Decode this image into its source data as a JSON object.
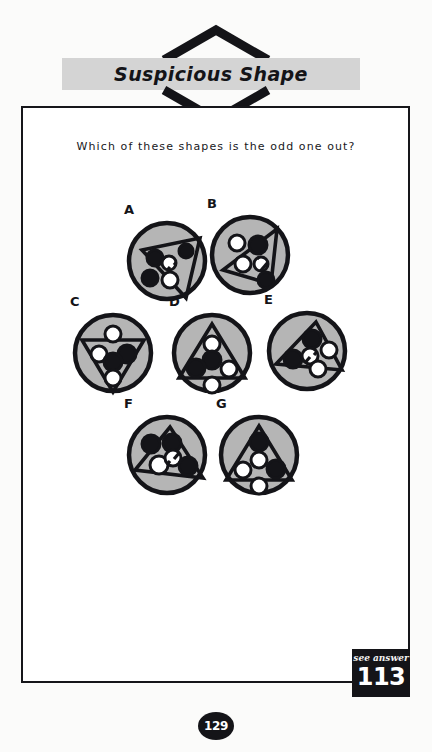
{
  "header": {
    "title": "Suspicious Shape",
    "band_color": "#d4d4d4",
    "chevron_icon": "chevron-diamond"
  },
  "question": {
    "text": "Which of these shapes is the odd one out?"
  },
  "footer": {
    "answer_label": "see answer",
    "answer_number": "113",
    "page_number": "129"
  },
  "colors": {
    "ink": "#141418",
    "disc_fill": "#b5b5b5",
    "paper": "#ffffff",
    "band": "#d4d4d4"
  },
  "puzzle": {
    "type": "odd-one-out",
    "count": 7,
    "shapes": [
      {
        "letter": "A",
        "row": 1,
        "triangle_rotation": 118,
        "triangle_points": "18,32 76,20 62,80",
        "dots": [
          {
            "name": "dot-black-left-upper",
            "cx": 31,
            "cy": 40,
            "r": 8,
            "fill": "black"
          },
          {
            "name": "dot-black-right-upper",
            "cx": 62,
            "cy": 33,
            "r": 7,
            "fill": "black"
          },
          {
            "name": "dot-slashed-center",
            "cx": 45,
            "cy": 45,
            "r": 7,
            "fill": "slashed"
          },
          {
            "name": "dot-black-left-lower",
            "cx": 26,
            "cy": 60,
            "r": 8,
            "fill": "black"
          },
          {
            "name": "dot-white-lower",
            "cx": 46,
            "cy": 62,
            "r": 8,
            "fill": "white"
          }
        ]
      },
      {
        "letter": "B",
        "row": 1,
        "triangle_rotation": 200,
        "triangle_points": "16,58 70,17 64,72",
        "dots": [
          {
            "name": "dot-white-top-left",
            "cx": 30,
            "cy": 31,
            "r": 8,
            "fill": "white"
          },
          {
            "name": "dot-black-top-center",
            "cx": 51,
            "cy": 33,
            "r": 9,
            "fill": "black"
          },
          {
            "name": "dot-white-mid-left",
            "cx": 36,
            "cy": 52,
            "r": 8,
            "fill": "white"
          },
          {
            "name": "dot-slashed-center",
            "cx": 54,
            "cy": 52,
            "r": 7,
            "fill": "slashed"
          },
          {
            "name": "dot-black-bottom",
            "cx": 59,
            "cy": 68,
            "r": 8,
            "fill": "black"
          }
        ]
      },
      {
        "letter": "C",
        "row": 2,
        "triangle_rotation": 180,
        "triangle_points": "12,30 74,30 43,82",
        "dots": [
          {
            "name": "dot-white-apex-top",
            "cx": 43,
            "cy": 24,
            "r": 8,
            "fill": "white"
          },
          {
            "name": "dot-white-left",
            "cx": 29,
            "cy": 44,
            "r": 8,
            "fill": "white"
          },
          {
            "name": "dot-black-right",
            "cx": 57,
            "cy": 44,
            "r": 9,
            "fill": "black"
          },
          {
            "name": "dot-hatched-center",
            "cx": 43,
            "cy": 52,
            "r": 9,
            "fill": "black"
          },
          {
            "name": "dot-white-bottom",
            "cx": 43,
            "cy": 68,
            "r": 8,
            "fill": "white"
          }
        ]
      },
      {
        "letter": "D",
        "row": 2,
        "triangle_rotation": 0,
        "triangle_points": "43,14 76,68 10,68",
        "dots": [
          {
            "name": "dot-white-top",
            "cx": 43,
            "cy": 34,
            "r": 8,
            "fill": "white"
          },
          {
            "name": "dot-black-center",
            "cx": 43,
            "cy": 50,
            "r": 9,
            "fill": "black"
          },
          {
            "name": "dot-black-left",
            "cx": 27,
            "cy": 58,
            "r": 9,
            "fill": "black"
          },
          {
            "name": "dot-white-right",
            "cx": 60,
            "cy": 59,
            "r": 8,
            "fill": "white"
          },
          {
            "name": "dot-white-bottom",
            "cx": 43,
            "cy": 75,
            "r": 8,
            "fill": "white"
          }
        ]
      },
      {
        "letter": "E",
        "row": 2,
        "triangle_rotation": 22,
        "triangle_points": "52,14 78,62 12,56",
        "dots": [
          {
            "name": "dot-black-top",
            "cx": 48,
            "cy": 31,
            "r": 9,
            "fill": "black"
          },
          {
            "name": "dot-white-right",
            "cx": 65,
            "cy": 42,
            "r": 8,
            "fill": "white"
          },
          {
            "name": "dot-black-left",
            "cx": 29,
            "cy": 51,
            "r": 9,
            "fill": "black"
          },
          {
            "name": "dot-slashed-center",
            "cx": 46,
            "cy": 48,
            "r": 8,
            "fill": "slashed"
          },
          {
            "name": "dot-white-bottom",
            "cx": 54,
            "cy": 61,
            "r": 8,
            "fill": "white"
          }
        ]
      },
      {
        "letter": "F",
        "row": 3,
        "triangle_rotation": 0,
        "triangle_points": "46,15 79,66 11,58",
        "dots": [
          {
            "name": "dot-black-upper-left",
            "cx": 27,
            "cy": 32,
            "r": 9,
            "fill": "black"
          },
          {
            "name": "dot-black-top",
            "cx": 48,
            "cy": 31,
            "r": 9,
            "fill": "black"
          },
          {
            "name": "dot-white-left",
            "cx": 35,
            "cy": 53,
            "r": 9,
            "fill": "white"
          },
          {
            "name": "dot-slashed-center",
            "cx": 49,
            "cy": 46,
            "r": 8,
            "fill": "slashed"
          },
          {
            "name": "dot-black-right",
            "cx": 64,
            "cy": 54,
            "r": 9,
            "fill": "black"
          }
        ]
      },
      {
        "letter": "G",
        "row": 3,
        "triangle_rotation": 0,
        "triangle_points": "43,14 76,68 10,68",
        "dots": [
          {
            "name": "dot-black-top",
            "cx": 43,
            "cy": 30,
            "r": 9,
            "fill": "black"
          },
          {
            "name": "dot-white-center",
            "cx": 43,
            "cy": 48,
            "r": 8,
            "fill": "white"
          },
          {
            "name": "dot-white-left",
            "cx": 27,
            "cy": 58,
            "r": 8,
            "fill": "white"
          },
          {
            "name": "dot-black-right",
            "cx": 60,
            "cy": 57,
            "r": 9,
            "fill": "black"
          },
          {
            "name": "dot-white-bottom",
            "cx": 43,
            "cy": 74,
            "r": 8,
            "fill": "white"
          }
        ]
      }
    ]
  }
}
